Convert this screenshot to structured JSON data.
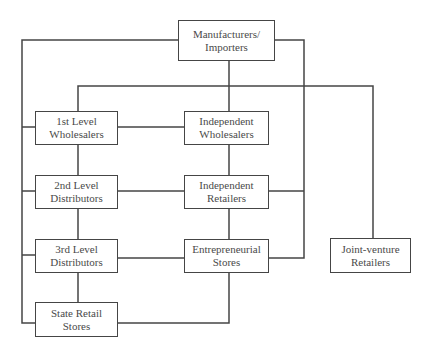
{
  "diagram": {
    "type": "distribution-channel-flowchart",
    "nodes": [
      {
        "id": "manufacturers",
        "line1": "Manufacturers/",
        "line2": "Importers"
      },
      {
        "id": "first-level",
        "line1": "1st Level",
        "line2": "Wholesalers"
      },
      {
        "id": "independent-wholesalers",
        "line1": "Independent",
        "line2": "Wholesalers"
      },
      {
        "id": "second-level",
        "line1": "2nd Level",
        "line2": "Distributors"
      },
      {
        "id": "independent-retailers",
        "line1": "Independent",
        "line2": "Retailers"
      },
      {
        "id": "third-level",
        "line1": "3rd Level",
        "line2": "Distributors"
      },
      {
        "id": "entrepreneurial",
        "line1": "Entrepreneurial",
        "line2": "Stores"
      },
      {
        "id": "joint-venture",
        "line1": "Joint-venture",
        "line2": "Retailers"
      },
      {
        "id": "state-retail",
        "line1": "State Retail",
        "line2": "Stores"
      }
    ],
    "edges": [
      [
        "manufacturers",
        "first-level"
      ],
      [
        "manufacturers",
        "independent-wholesalers"
      ],
      [
        "manufacturers",
        "joint-venture"
      ],
      [
        "manufacturers",
        "second-level"
      ],
      [
        "manufacturers",
        "third-level"
      ],
      [
        "manufacturers",
        "state-retail"
      ],
      [
        "manufacturers",
        "independent-retailers"
      ],
      [
        "manufacturers",
        "entrepreneurial"
      ],
      [
        "first-level",
        "independent-wholesalers"
      ],
      [
        "first-level",
        "second-level"
      ],
      [
        "second-level",
        "independent-retailers"
      ],
      [
        "second-level",
        "third-level"
      ],
      [
        "independent-wholesalers",
        "independent-retailers"
      ],
      [
        "independent-retailers",
        "entrepreneurial"
      ],
      [
        "third-level",
        "entrepreneurial"
      ],
      [
        "third-level",
        "state-retail"
      ],
      [
        "entrepreneurial",
        "state-retail"
      ]
    ]
  }
}
